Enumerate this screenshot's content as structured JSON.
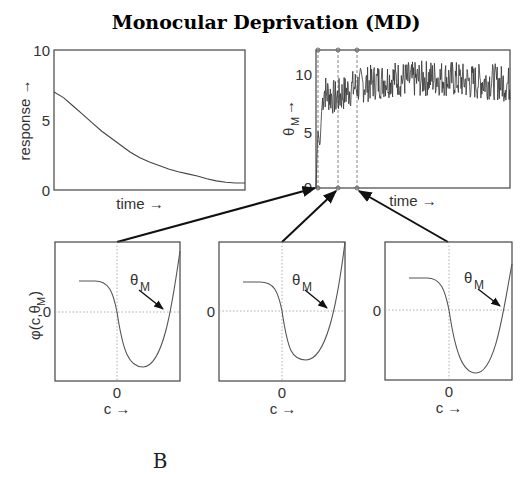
{
  "figure": {
    "title": "Monocular Deprivation (MD)",
    "panel_letter": "B"
  },
  "chart_data": [
    {
      "type": "line",
      "id": "response",
      "title": "",
      "xlabel": "time →",
      "ylabel": "response →",
      "ylim": [
        0,
        10
      ],
      "yticks": [
        "0",
        "5",
        "10"
      ],
      "grid": false,
      "x": [
        0,
        0.05,
        0.1,
        0.15,
        0.2,
        0.25,
        0.3,
        0.35,
        0.4,
        0.45,
        0.5,
        0.55,
        0.6,
        0.65,
        0.7,
        0.75,
        0.8,
        0.85,
        0.9,
        0.95,
        1.0
      ],
      "values": [
        7.0,
        6.6,
        6.0,
        5.4,
        4.8,
        4.2,
        3.7,
        3.2,
        2.7,
        2.3,
        2.0,
        1.75,
        1.5,
        1.3,
        1.15,
        1.0,
        0.8,
        0.65,
        0.55,
        0.5,
        0.5
      ]
    },
    {
      "type": "line",
      "id": "theta_m",
      "title": "",
      "xlabel": "time →",
      "ylabel": "θM →",
      "ylim": [
        0,
        12
      ],
      "yticks": [
        "0",
        "5",
        "10"
      ],
      "grid": false,
      "markers_at_x": [
        0.01,
        0.11,
        0.21
      ],
      "description": "noisy trace: rises quickly from ~0 to ~4 then ~8, fluctuates between ~7 and ~12 around a mean of ~9",
      "x": [
        0,
        0.01,
        0.02,
        0.03,
        0.04,
        0.06,
        0.08,
        0.1,
        0.15,
        0.2,
        0.3,
        0.4,
        0.5,
        0.6,
        0.7,
        0.8,
        0.9,
        1.0
      ],
      "values": [
        0,
        5,
        3.5,
        7,
        8.5,
        8.2,
        8.0,
        7.8,
        8.3,
        8.8,
        9.2,
        9.5,
        9.4,
        9.6,
        9.5,
        9.2,
        9.3,
        9.0
      ]
    },
    {
      "type": "line",
      "id": "phi_1",
      "xlabel": "c →",
      "ylabel": "φ(c,θM)",
      "xtick": "0",
      "ytick": "0",
      "annotation": "θM",
      "dotted_axes": true,
      "theta_position": 0.8
    },
    {
      "type": "line",
      "id": "phi_2",
      "xlabel": "c →",
      "ylabel": "",
      "xtick": "0",
      "ytick": "0",
      "annotation": "θM",
      "dotted_axes": true,
      "theta_position": 0.75
    },
    {
      "type": "line",
      "id": "phi_3",
      "xlabel": "c →",
      "ylabel": "",
      "xtick": "0",
      "ytick": "0",
      "annotation": "θM",
      "dotted_axes": true,
      "theta_position": 0.85
    }
  ],
  "labels": {
    "left_ylabel": "response →",
    "left_xlabel": "time →",
    "right_ylabel_theta": "θ",
    "right_ylabel_sub": "M",
    "right_ylabel_arrow": "→",
    "right_xlabel": "time →",
    "tick_0": "0",
    "tick_5": "5",
    "tick_10": "10",
    "phi_ylabel": "φ(c,θ",
    "phi_ylabel_sub": "M",
    "phi_ylabel_close": ")",
    "c_label": "c →",
    "theta": "θ",
    "theta_sub": "M"
  },
  "colors": {
    "axis": "#333333",
    "line": "#333333",
    "dotted": "#999999"
  }
}
